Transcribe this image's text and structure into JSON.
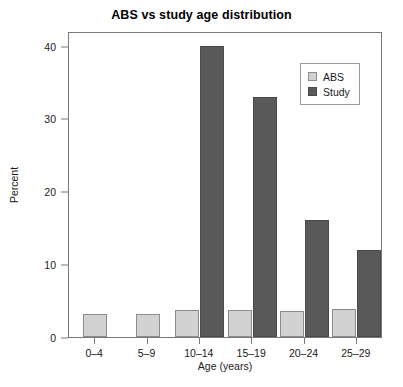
{
  "chart_data": {
    "type": "bar",
    "title": "ABS vs study age distribution",
    "xlabel": "Age (years)",
    "ylabel": "Percent",
    "categories": [
      "0–4",
      "5–9",
      "10–14",
      "15–19",
      "20–24",
      "25–29"
    ],
    "series": [
      {
        "name": "ABS",
        "color": "#d2d2d2",
        "values": [
          3.1,
          3.2,
          3.7,
          3.7,
          3.6,
          3.8
        ]
      },
      {
        "name": "Study",
        "color": "#595959",
        "values": [
          0,
          0,
          40,
          33,
          16,
          12
        ]
      }
    ],
    "ylim": [
      0,
      42
    ],
    "yticks": [
      0,
      10,
      20,
      30,
      40
    ],
    "ytick_labels": [
      "0",
      "10",
      "20",
      "30",
      "40"
    ],
    "grid": false,
    "legend_position": "top-right"
  },
  "legend": {
    "items": [
      {
        "label": "ABS"
      },
      {
        "label": "Study"
      }
    ]
  }
}
